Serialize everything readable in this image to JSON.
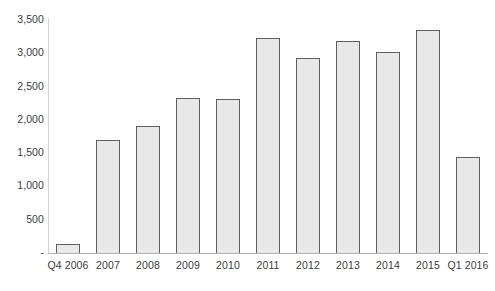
{
  "chart_data": {
    "type": "bar",
    "title": "",
    "subtitle": "",
    "xlabel": "",
    "ylabel": "",
    "categories": [
      "Q4 2006",
      "2007",
      "2008",
      "2009",
      "2010",
      "2011",
      "2012",
      "2013",
      "2014",
      "2015",
      "Q1 2016"
    ],
    "values": [
      150,
      1720,
      1930,
      2340,
      2330,
      3250,
      2950,
      3200,
      3040,
      3360,
      1450
    ],
    "series": [
      {
        "name": "",
        "values": [
          150,
          1720,
          1930,
          2340,
          2330,
          3250,
          2950,
          3200,
          3040,
          3360,
          1450
        ]
      }
    ],
    "ylim": [
      0,
      3500
    ],
    "ytick_values": [
      0,
      500,
      1000,
      1500,
      2000,
      2500,
      3000,
      3500
    ],
    "ytick_labels": [
      "-",
      "500",
      "1,000",
      "1,500",
      "2,000",
      "2,500",
      "3,000",
      "3,500"
    ],
    "grid": false,
    "legend": false,
    "legend_position": "none",
    "bar_fill_color": "#e8e8e8",
    "bar_border_color": "#5e5e5e",
    "axis_color": "#b3b3b3",
    "text_color": "#3b3b3b"
  }
}
